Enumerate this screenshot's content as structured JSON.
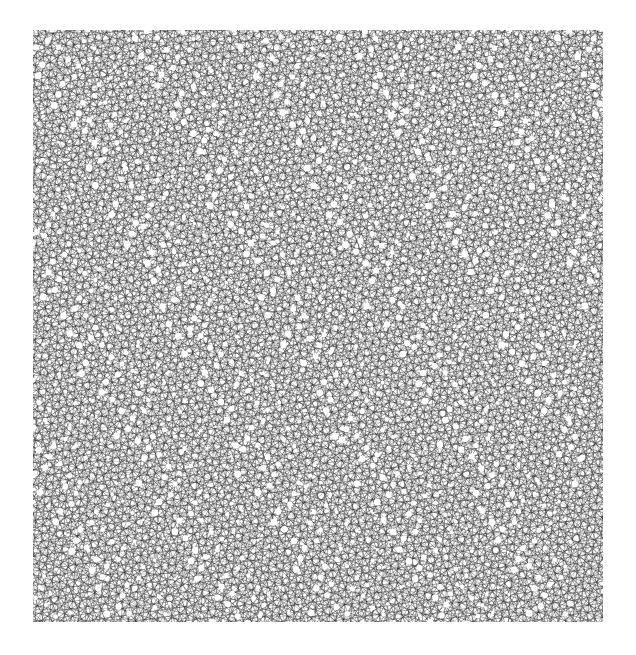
{
  "artwork": {
    "title": "Quasiperiodic Multigrid Line Arrangement",
    "medium": "generative line drawing",
    "canvas": {
      "width": 636,
      "height": 655,
      "background_color": "#ffffff"
    },
    "plot_area": {
      "x": 33,
      "y": 30,
      "width": 570,
      "height": 592
    },
    "stroke": {
      "color": "#1a1a1a",
      "width": 0.42,
      "opacity": 0.92
    },
    "construction": {
      "method": "de-bruijn-multigrid",
      "symmetry_order": 7,
      "line_families": 7,
      "lines_per_family": 116,
      "family_spacing": 7.15,
      "offset_sequence": "golden-ratio-irrational",
      "golden_ratio": 1.6180339887,
      "rotation_deg": 4.5,
      "secondary_grid": {
        "enabled": true,
        "symmetry_order": 5,
        "lines_per_family": 74,
        "family_spacing": 11.3,
        "rotation_deg": 17.0,
        "opacity": 0.55
      }
    },
    "motifs": {
      "description": "white rosette voids at high-valence line convergences",
      "void_color": "#ffffff",
      "approximate_count": 1450
    }
  },
  "chart_data": {
    "type": "scatter",
    "xlabel": "",
    "ylabel": "",
    "xlim": [
      33,
      603
    ],
    "ylim": [
      30,
      622
    ],
    "grid": false,
    "legend_position": "none",
    "series": [
      {
        "name": "primary heptagrid",
        "symmetry": 7,
        "line_count": 812,
        "spacing": 7.15,
        "angle_step_deg": 25.714
      },
      {
        "name": "secondary pentagrid",
        "symmetry": 5,
        "line_count": 370,
        "spacing": 11.3,
        "angle_step_deg": 36.0
      }
    ]
  }
}
